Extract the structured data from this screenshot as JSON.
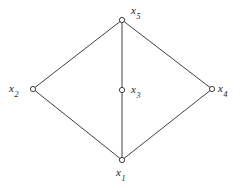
{
  "figure": {
    "type": "undirected-graph-diagram",
    "background_color": "#ffffff",
    "stroke_color": "#2b2b2b",
    "label_color": "#1a1a1a",
    "width": 245,
    "height": 188
  },
  "nodes": [
    {
      "id": "x5",
      "base": "x",
      "subscript": "5",
      "label": "x5",
      "x": 122,
      "y": 20,
      "label_x": 131,
      "label_y": 5,
      "label_anchor": "upper-right"
    },
    {
      "id": "x2",
      "base": "x",
      "subscript": "2",
      "label": "x2",
      "x": 33,
      "y": 89,
      "label_x": 9,
      "label_y": 83,
      "label_anchor": "left"
    },
    {
      "id": "x3",
      "base": "x",
      "subscript": "3",
      "label": "x3",
      "x": 122,
      "y": 90,
      "label_x": 131,
      "label_y": 84,
      "label_anchor": "right"
    },
    {
      "id": "x4",
      "base": "x",
      "subscript": "4",
      "label": "x4",
      "x": 212,
      "y": 89,
      "label_x": 218,
      "label_y": 83,
      "label_anchor": "right"
    },
    {
      "id": "x1",
      "base": "x",
      "subscript": "1",
      "label": "x1",
      "x": 122,
      "y": 160,
      "label_x": 116,
      "label_y": 167,
      "label_anchor": "below"
    }
  ],
  "edges": [
    {
      "from": "x5",
      "to": "x2",
      "x1": 122,
      "y1": 20,
      "x2": 33,
      "y2": 89
    },
    {
      "from": "x5",
      "to": "x4",
      "x1": 122,
      "y1": 20,
      "x2": 212,
      "y2": 89
    },
    {
      "from": "x2",
      "to": "x1",
      "x1": 33,
      "y1": 89,
      "x2": 122,
      "y2": 160
    },
    {
      "from": "x4",
      "to": "x1",
      "x1": 212,
      "y1": 89,
      "x2": 122,
      "y2": 160
    },
    {
      "from": "x5",
      "to": "x1",
      "x1": 122,
      "y1": 20,
      "x2": 122,
      "y2": 160
    }
  ],
  "node_radius": 2.6
}
